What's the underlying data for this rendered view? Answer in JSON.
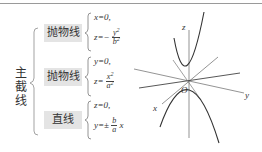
{
  "main_label": [
    "主",
    "截",
    "线"
  ],
  "branches": [
    {
      "label": "抛物线",
      "eq1": "x=0,",
      "eq2_lhs": "z=−",
      "eq2_num": "y",
      "eq2_num_sup": "2",
      "eq2_den": "b",
      "eq2_den_sup": "2",
      "eq2_tail": ""
    },
    {
      "label": "抛物线",
      "eq1": "y=0,",
      "eq2_lhs": "z=",
      "eq2_num": "x",
      "eq2_num_sup": "2",
      "eq2_den": "a",
      "eq2_den_sup": "2",
      "eq2_tail": ""
    },
    {
      "label": "直线",
      "eq1": "z=0,",
      "eq2_lhs": "y=±",
      "eq2_num": "b",
      "eq2_num_sup": "",
      "eq2_den": "a",
      "eq2_den_sup": "",
      "eq2_tail": "x"
    }
  ],
  "diagram": {
    "axis_z": "z",
    "axis_x": "x",
    "axis_y": "y",
    "origin": "O"
  },
  "colors": {
    "box_bg": "#e4e4e4",
    "line": "#555555",
    "bracket": "#999999"
  }
}
